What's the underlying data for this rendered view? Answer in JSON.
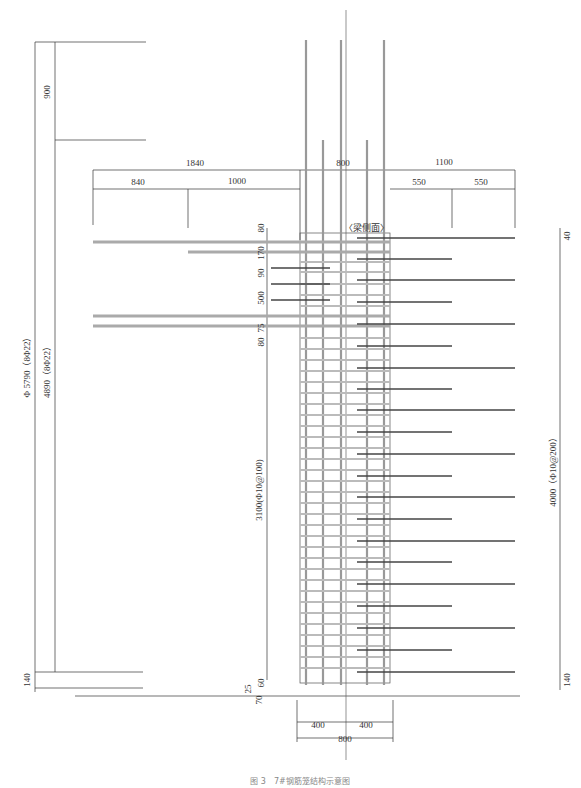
{
  "drawing": {
    "caption": "图 3　7#钢筋笼结构示意图",
    "section_label": "〈梁侧面〉",
    "colors": {
      "line": "#333333",
      "rebar_light": "#aaaaaa",
      "rebar_dark": "#444444"
    }
  },
  "dimensions": {
    "top_left_vertical": "900",
    "left_total": "1840",
    "left_sub_1": "840",
    "left_sub_2": "1000",
    "center_width_top": "800",
    "right_total": "1100",
    "right_sub_1": "550",
    "right_sub_2": "550",
    "right_top_small": "40",
    "right_bottom_small": "140",
    "left_outer_vertical": "Φ 5790（8Φ22）",
    "left_inner_vertical": "4890（8Φ22）",
    "left_bottom_small": "140",
    "stirrup_zone": "3100(Φ10@100)",
    "right_vertical": "4000（Φ10@200）",
    "beam_zone": [
      "80",
      "170",
      "90",
      "500",
      "75",
      "80"
    ],
    "base_zone": [
      "60",
      "25",
      "70"
    ],
    "bottom_half_left": "400",
    "bottom_half_right": "400",
    "bottom_total": "800"
  }
}
